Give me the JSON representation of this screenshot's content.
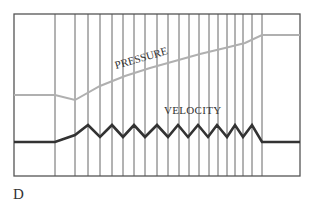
{
  "figure": {
    "panel_label": "D",
    "labels": {
      "pressure": "PRESSURE",
      "velocity": "VELOCITY"
    },
    "colors": {
      "frame": "#555555",
      "grid_lines": "#666666",
      "pressure_curve": "#b0b0b0",
      "velocity_curve": "#333333",
      "text": "#333333"
    },
    "frame": {
      "x1": 14,
      "y1": 14,
      "x2": 300,
      "y2": 176
    },
    "vertical_lines_x": [
      55,
      75,
      88,
      100,
      112,
      123,
      134,
      145,
      157,
      168,
      179,
      189,
      199,
      209,
      218,
      227,
      235,
      243,
      252,
      262
    ],
    "pressure_points": [
      [
        14,
        95
      ],
      [
        55,
        95
      ],
      [
        75,
        100
      ],
      [
        100,
        86
      ],
      [
        125,
        76
      ],
      [
        150,
        68
      ],
      [
        175,
        61
      ],
      [
        200,
        54
      ],
      [
        225,
        48
      ],
      [
        245,
        43
      ],
      [
        262,
        35
      ],
      [
        300,
        35
      ]
    ],
    "velocity_points": [
      [
        14,
        142
      ],
      [
        55,
        142
      ],
      [
        75,
        135
      ],
      [
        88,
        125
      ],
      [
        100,
        137
      ],
      [
        112,
        125
      ],
      [
        123,
        137
      ],
      [
        134,
        125
      ],
      [
        145,
        137
      ],
      [
        157,
        125
      ],
      [
        168,
        137
      ],
      [
        178,
        125
      ],
      [
        188,
        137
      ],
      [
        198,
        125
      ],
      [
        208,
        137
      ],
      [
        217,
        125
      ],
      [
        227,
        137
      ],
      [
        235,
        125
      ],
      [
        243,
        137
      ],
      [
        252,
        125
      ],
      [
        262,
        142
      ],
      [
        300,
        142
      ]
    ]
  }
}
